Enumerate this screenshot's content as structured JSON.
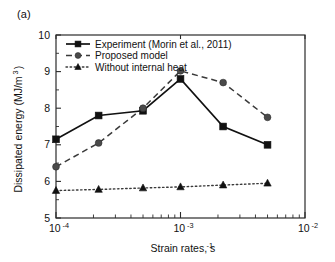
{
  "panel": {
    "label": "(a)"
  },
  "chart_data": {
    "type": "line",
    "title": "",
    "xlabel": "Strain rates, s",
    "xlabel_sup": "-1",
    "ylabel": "Dissipated energy (MJ/m",
    "ylabel_sup": "3",
    "ylabel_close": ")",
    "xscale": "log",
    "yscale": "linear",
    "xlim": [
      0.0001,
      0.01
    ],
    "ylim": [
      5,
      10
    ],
    "grid": false,
    "legend_position": "upper-left",
    "ytick_labels": [
      "5",
      "6",
      "7",
      "8",
      "9",
      "10"
    ],
    "ytick_values": [
      5,
      6,
      7,
      8,
      9,
      10
    ],
    "xtick_labels": [
      "10",
      "10",
      "10"
    ],
    "xtick_sups": [
      "-4",
      "-3",
      "-2"
    ],
    "xtick_values": [
      0.0001,
      0.001,
      0.01
    ],
    "x": [
      0.0001,
      0.00022,
      0.0005,
      0.001,
      0.0022,
      0.005
    ],
    "series": [
      {
        "name": "Experiment (Morin et al., 2011)",
        "marker": "square",
        "linestyle": "solid",
        "color": "#111111",
        "values": [
          7.15,
          7.8,
          7.93,
          8.8,
          7.5,
          7.0
        ]
      },
      {
        "name": "Proposed model",
        "marker": "circle",
        "linestyle": "dashed",
        "color": "#4a4a4a",
        "values": [
          6.4,
          7.05,
          8.0,
          9.02,
          8.7,
          7.75
        ]
      },
      {
        "name": "Without internal heat",
        "marker": "triangle",
        "linestyle": "dotted",
        "color": "#111111",
        "values": [
          5.75,
          5.78,
          5.82,
          5.85,
          5.9,
          5.95
        ]
      }
    ]
  }
}
